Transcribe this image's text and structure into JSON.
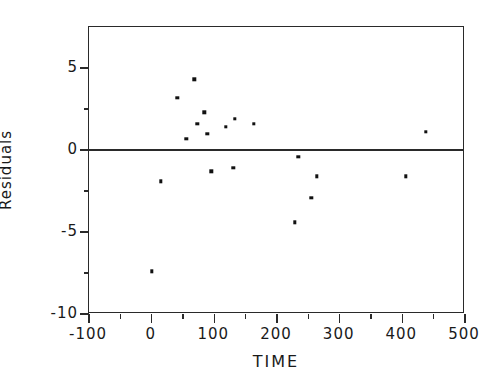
{
  "chart_data": {
    "type": "scatter",
    "title": "",
    "xlabel": "TIME",
    "ylabel": "Residuals",
    "xlim": [
      -100,
      500
    ],
    "ylim": [
      -10,
      7.5
    ],
    "grid": false,
    "legend": null,
    "xticks": [
      -100,
      0,
      100,
      200,
      300,
      400,
      500
    ],
    "xtick_labels": [
      "-100",
      "0",
      "100",
      "200",
      "300",
      "400",
      "500"
    ],
    "xminorticks": [
      -50,
      50,
      150,
      250,
      350,
      450
    ],
    "yticks": [
      5,
      0,
      -5,
      -10
    ],
    "ytick_labels": [
      "5",
      "0",
      "-5",
      "-10"
    ],
    "yminorticks": [
      2.5,
      -2.5,
      -7.5
    ],
    "reference_line": {
      "y": 0,
      "orientation": "horizontal"
    },
    "marker": "square",
    "marker_color": "#111111",
    "points": [
      {
        "x": 0,
        "y": -7.4
      },
      {
        "x": 15,
        "y": -1.9
      },
      {
        "x": 41,
        "y": 3.2
      },
      {
        "x": 55,
        "y": 0.7
      },
      {
        "x": 68,
        "y": 4.3
      },
      {
        "x": 73,
        "y": 1.6
      },
      {
        "x": 84,
        "y": 2.3
      },
      {
        "x": 89,
        "y": 1.0
      },
      {
        "x": 95,
        "y": -1.3
      },
      {
        "x": 118,
        "y": 1.4
      },
      {
        "x": 130,
        "y": -1.1
      },
      {
        "x": 133,
        "y": 1.9
      },
      {
        "x": 163,
        "y": 1.6
      },
      {
        "x": 228,
        "y": -4.4
      },
      {
        "x": 234,
        "y": -0.4
      },
      {
        "x": 255,
        "y": -2.9
      },
      {
        "x": 264,
        "y": -1.6
      },
      {
        "x": 406,
        "y": -1.6
      },
      {
        "x": 437,
        "y": 1.1
      }
    ]
  },
  "axes": {
    "x_title": "TIME",
    "y_title": "Residuals"
  }
}
